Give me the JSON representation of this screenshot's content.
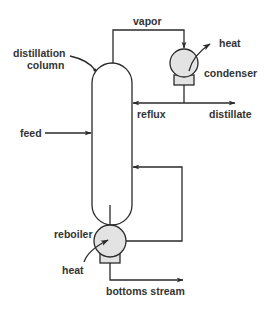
{
  "diagram": {
    "colors": {
      "line": "#2a2a2a",
      "text": "#333333",
      "exchanger_fill": "#e3e3e3",
      "background": "#ffffff"
    },
    "labels": {
      "vapor": "vapor",
      "distillation_column_line1": "distillation",
      "distillation_column_line2": "column",
      "condenser_heat": "heat",
      "condenser": "condenser",
      "reflux": "reflux",
      "distillate": "distillate",
      "feed": "feed",
      "reboiler": "reboiler",
      "reboiler_heat": "heat",
      "bottoms_stream": "bottoms stream"
    },
    "components": [
      {
        "id": "distillation-column",
        "type": "vessel"
      },
      {
        "id": "condenser",
        "type": "heat-exchanger"
      },
      {
        "id": "reboiler",
        "type": "heat-exchanger"
      }
    ],
    "streams": [
      {
        "id": "feed",
        "from": "outside",
        "to": "distillation-column"
      },
      {
        "id": "vapor",
        "from": "distillation-column",
        "to": "condenser"
      },
      {
        "id": "reflux",
        "from": "condenser",
        "to": "distillation-column"
      },
      {
        "id": "distillate",
        "from": "condenser",
        "to": "outside"
      },
      {
        "id": "reboiler-return",
        "from": "reboiler",
        "to": "distillation-column"
      },
      {
        "id": "bottoms-stream",
        "from": "reboiler",
        "to": "outside"
      }
    ]
  }
}
